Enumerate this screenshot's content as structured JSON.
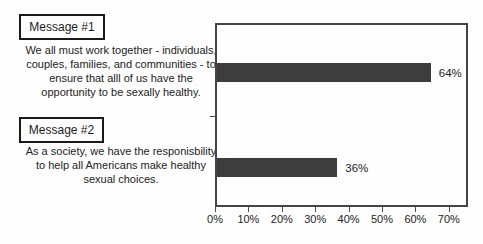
{
  "left_panel": {
    "messages": [
      {
        "label": "Message #1",
        "lines": [
          "We all must work together - individuals,",
          "couples, families, and communities - to",
          "ensure that alll of us have the",
          "opportunity to be sexally healthy."
        ]
      },
      {
        "label": "Message #2",
        "lines": [
          "As a society, we have the responisbility",
          "to help all Americans make healthy",
          "sexual choices."
        ]
      }
    ]
  },
  "chart_data": {
    "type": "bar",
    "orientation": "horizontal",
    "title": "",
    "xlabel": "",
    "ylabel": "",
    "categories": [
      "Message #1",
      "Message #2"
    ],
    "values": [
      64,
      36
    ],
    "value_labels": [
      "64%",
      "36%"
    ],
    "xlim": [
      0,
      75
    ],
    "x_ticks": [
      {
        "value": 0,
        "label": "0%"
      },
      {
        "value": 10,
        "label": "10%"
      },
      {
        "value": 20,
        "label": "20%"
      },
      {
        "value": 30,
        "label": "30%"
      },
      {
        "value": 40,
        "label": "40%"
      },
      {
        "value": 50,
        "label": "50%"
      },
      {
        "value": 60,
        "label": "60%"
      },
      {
        "value": 70,
        "label": "70%"
      }
    ],
    "grid": false,
    "legend": false,
    "bar_color": "#3d3d3d",
    "axis_color": "#454545"
  }
}
